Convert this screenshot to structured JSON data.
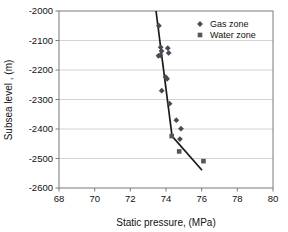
{
  "chart_data": {
    "type": "scatter",
    "title": "",
    "xlabel": "Static pressure, (MPa)",
    "ylabel": "Subsea level , (m)",
    "xlim": [
      68,
      80
    ],
    "ylim": [
      -2600,
      -2000
    ],
    "xticks": [
      68,
      70,
      72,
      74,
      76,
      78,
      80
    ],
    "yticks": [
      -2000,
      -2100,
      -2200,
      -2300,
      -2400,
      -2500,
      -2600
    ],
    "xtick_labels": [
      "68",
      "70",
      "72",
      "74",
      "76",
      "78",
      "80"
    ],
    "ytick_labels": [
      "-2000",
      "-2100",
      "-2200",
      "-2300",
      "-2400",
      "-2500",
      "-2600"
    ],
    "grid": {
      "horizontal": true,
      "vertical": false
    },
    "legend": {
      "position": "top-right",
      "entries": [
        {
          "name": "Gas zone",
          "marker": "diamond",
          "color": "#4a4a55"
        },
        {
          "name": "Water zone",
          "marker": "square",
          "color": "#555560"
        }
      ]
    },
    "series": [
      {
        "name": "Gas zone",
        "marker": "diamond",
        "color": "#4a4a55",
        "points": [
          {
            "x": 73.6,
            "y": -2050
          },
          {
            "x": 73.7,
            "y": -2123
          },
          {
            "x": 73.75,
            "y": -2136
          },
          {
            "x": 74.1,
            "y": -2126
          },
          {
            "x": 74.15,
            "y": -2142
          },
          {
            "x": 73.58,
            "y": -2152
          },
          {
            "x": 73.68,
            "y": -2150
          },
          {
            "x": 73.98,
            "y": -2224
          },
          {
            "x": 74.06,
            "y": -2230
          },
          {
            "x": 73.76,
            "y": -2270
          },
          {
            "x": 74.2,
            "y": -2314
          },
          {
            "x": 74.58,
            "y": -2370
          },
          {
            "x": 74.84,
            "y": -2399
          },
          {
            "x": 74.78,
            "y": -2434
          }
        ]
      },
      {
        "name": "Water zone",
        "marker": "square",
        "color": "#555560",
        "points": [
          {
            "x": 74.32,
            "y": -2424
          },
          {
            "x": 74.74,
            "y": -2476
          },
          {
            "x": 76.1,
            "y": -2509
          }
        ]
      }
    ],
    "trendlines": [
      {
        "name": "gas-gradient-line",
        "color": "#1a1a1a",
        "x1": 73.44,
        "y1": -2000,
        "x2": 74.34,
        "y2": -2424
      },
      {
        "name": "water-gradient-line",
        "color": "#1a1a1a",
        "x1": 74.34,
        "y1": -2424,
        "x2": 76.02,
        "y2": -2540
      }
    ]
  }
}
